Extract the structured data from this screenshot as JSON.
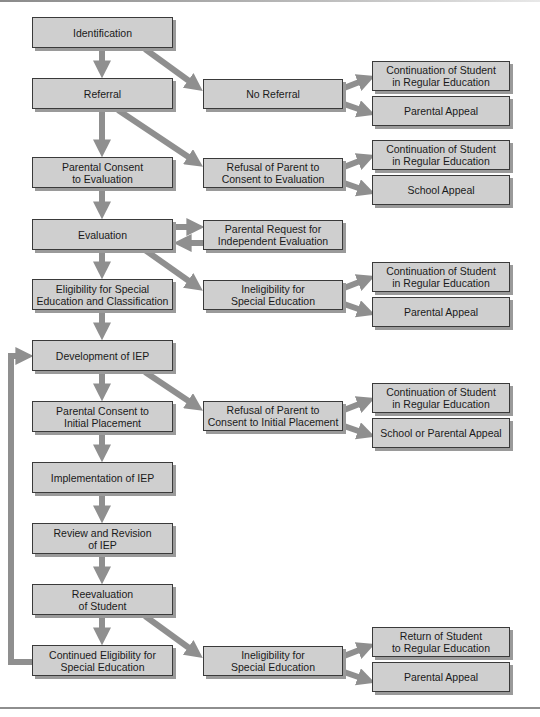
{
  "diagram": {
    "type": "flowchart",
    "colors": {
      "box_fill": "#cfcfcf",
      "box_border": "#3a3a3a",
      "shadow": "#9a9a9a",
      "arrow": "#8f8f8f"
    },
    "main_flow": [
      {
        "id": "identification",
        "label": "Identification"
      },
      {
        "id": "referral",
        "label": "Referral"
      },
      {
        "id": "consent_eval",
        "label": "Parental Consent\nto Evaluation"
      },
      {
        "id": "evaluation",
        "label": "Evaluation"
      },
      {
        "id": "eligibility",
        "label": "Eligibility for Special\nEducation and Classification"
      },
      {
        "id": "development",
        "label": "Development of IEP"
      },
      {
        "id": "consent_placement",
        "label": "Parental Consent to\nInitial Placement"
      },
      {
        "id": "implementation",
        "label": "Implementation of IEP"
      },
      {
        "id": "review",
        "label": "Review and Revision\nof IEP"
      },
      {
        "id": "reevaluation",
        "label": "Reevaluation\nof Student"
      },
      {
        "id": "continued",
        "label": "Continued Eligibility for\nSpecial Education"
      }
    ],
    "branches": [
      {
        "id": "no_referral",
        "label": "No Referral",
        "from": "identification"
      },
      {
        "id": "refusal_eval",
        "label": "Refusal of Parent to\nConsent to Evaluation",
        "from": "referral"
      },
      {
        "id": "independent_eval",
        "label": "Parental Request for\nIndependent Evaluation",
        "from": "evaluation"
      },
      {
        "id": "ineligibility1",
        "label": "Ineligibility for\nSpecial Education",
        "from": "evaluation"
      },
      {
        "id": "refusal_placement",
        "label": "Refusal of Parent to\nConsent to Initial Placement",
        "from": "development"
      },
      {
        "id": "ineligibility2",
        "label": "Ineligibility for\nSpecial Education",
        "from": "reevaluation"
      }
    ],
    "outcomes": [
      {
        "id": "o1",
        "label": "Continuation of Student\nin Regular Education",
        "from": "no_referral"
      },
      {
        "id": "o2",
        "label": "Parental Appeal",
        "from": "no_referral"
      },
      {
        "id": "o3",
        "label": "Continuation of Student\nin Regular Education",
        "from": "refusal_eval"
      },
      {
        "id": "o4",
        "label": "School Appeal",
        "from": "refusal_eval"
      },
      {
        "id": "o5",
        "label": "Continuation of Student\nin Regular Education",
        "from": "ineligibility1"
      },
      {
        "id": "o6",
        "label": "Parental Appeal",
        "from": "ineligibility1"
      },
      {
        "id": "o7",
        "label": "Continuation of Student\nin Regular Education",
        "from": "refusal_placement"
      },
      {
        "id": "o8",
        "label": "School or Parental Appeal",
        "from": "refusal_placement"
      },
      {
        "id": "o9",
        "label": "Return of Student\nto Regular Education",
        "from": "ineligibility2"
      },
      {
        "id": "o10",
        "label": "Parental Appeal",
        "from": "ineligibility2"
      }
    ],
    "loop": {
      "from": "continued",
      "to": "development"
    }
  }
}
